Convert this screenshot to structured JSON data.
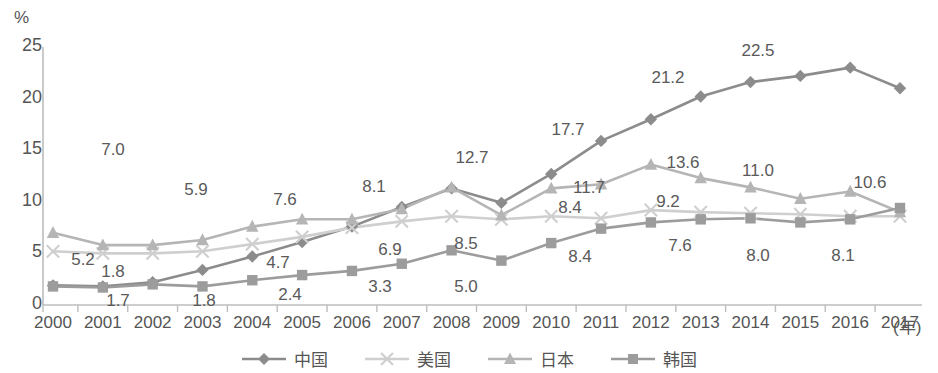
{
  "chart_data": {
    "type": "line",
    "title": "",
    "subtitle": "",
    "xlabel": "(年)",
    "ylabel": "%",
    "ylim": [
      0,
      25
    ],
    "yticks": [
      0,
      5,
      10,
      15,
      20,
      25
    ],
    "grid": false,
    "legend_position": "bottom",
    "categories": [
      "2000",
      "2001",
      "2002",
      "2003",
      "2004",
      "2005",
      "2006",
      "2007",
      "2008",
      "2009",
      "2010",
      "2011",
      "2012",
      "2013",
      "2014",
      "2015",
      "2016",
      "2017"
    ],
    "series": [
      {
        "name": "中国",
        "marker": "diamond",
        "color": "#8c8c8c",
        "values": [
          1.9,
          1.8,
          2.2,
          3.4,
          4.7,
          6.1,
          7.6,
          9.5,
          11.3,
          9.9,
          12.7,
          15.9,
          18.0,
          20.2,
          21.6,
          22.2,
          23.0,
          21.0
        ]
      },
      {
        "name": "美国",
        "marker": "cross",
        "color": "#cfcfcf",
        "values": [
          5.2,
          5.0,
          5.0,
          5.2,
          5.9,
          6.6,
          7.5,
          8.1,
          8.6,
          8.3,
          8.6,
          8.4,
          9.2,
          9.0,
          8.9,
          8.8,
          8.6,
          8.6
        ]
      },
      {
        "name": "日本",
        "marker": "triangle",
        "color": "#b5b5b5",
        "values": [
          7.0,
          5.8,
          5.8,
          6.3,
          7.6,
          8.3,
          8.3,
          9.3,
          11.4,
          8.7,
          11.3,
          11.7,
          13.6,
          12.3,
          11.4,
          10.3,
          11.0,
          9.0
        ]
      },
      {
        "name": "韩国",
        "marker": "square",
        "color": "#9c9c9c",
        "values": [
          1.8,
          1.7,
          2.0,
          1.8,
          2.4,
          2.9,
          3.3,
          4.0,
          5.3,
          4.3,
          6.0,
          7.4,
          8.0,
          8.3,
          8.4,
          8.0,
          8.3,
          9.4
        ]
      }
    ],
    "annotations": [
      {
        "text": "7.0",
        "series": "日本",
        "index": 1,
        "x": 113,
        "y": 140,
        "align": "above"
      },
      {
        "text": "5.2",
        "series": "美国",
        "index": 1,
        "x": 83,
        "y": 250,
        "align": "below"
      },
      {
        "text": "1.8",
        "series": "中国",
        "index": 1,
        "x": 113,
        "y": 262,
        "align": "above"
      },
      {
        "text": "1.7",
        "series": "韩国",
        "index": 1,
        "x": 118,
        "y": 291,
        "align": "below"
      },
      {
        "text": "5.9",
        "series": "日本",
        "index": 3,
        "x": 196,
        "y": 180,
        "align": "above"
      },
      {
        "text": "1.8",
        "series": "韩国",
        "index": 3,
        "x": 204,
        "y": 291,
        "align": "below"
      },
      {
        "text": "7.6",
        "series": "日本",
        "index": 5,
        "x": 285,
        "y": 190,
        "align": "above"
      },
      {
        "text": "4.7",
        "series": "中国",
        "index": 5,
        "x": 278,
        "y": 253,
        "align": "above"
      },
      {
        "text": "2.4",
        "series": "韩国",
        "index": 5,
        "x": 290,
        "y": 285,
        "align": "below"
      },
      {
        "text": "8.1",
        "series": "中国",
        "index": 7,
        "x": 374,
        "y": 177,
        "align": "above"
      },
      {
        "text": "6.9",
        "series": "韩国",
        "index": 7,
        "x": 390,
        "y": 240,
        "align": "above"
      },
      {
        "text": "3.3",
        "series": "韩国",
        "index": 7,
        "x": 380,
        "y": 277,
        "align": "below"
      },
      {
        "text": "12.7",
        "series": "中国",
        "index": 10,
        "x": 472,
        "y": 148,
        "align": "above"
      },
      {
        "text": "8.5",
        "series": "日本",
        "index": 9,
        "x": 466,
        "y": 234,
        "align": "below"
      },
      {
        "text": "5.0",
        "series": "韩国",
        "index": 9,
        "x": 466,
        "y": 277,
        "align": "below"
      },
      {
        "text": "17.7",
        "series": "中国",
        "index": 11,
        "x": 568,
        "y": 120,
        "align": "above"
      },
      {
        "text": "11.7",
        "series": "日本",
        "index": 11,
        "x": 589,
        "y": 178,
        "align": "below"
      },
      {
        "text": "8.4",
        "series": "美国",
        "index": 11,
        "x": 570,
        "y": 198,
        "align": "below"
      },
      {
        "text": "8.4",
        "series": "韩国",
        "index": 11,
        "x": 580,
        "y": 247,
        "align": "below"
      },
      {
        "text": "21.2",
        "series": "中国",
        "index": 13,
        "x": 668,
        "y": 68,
        "align": "above"
      },
      {
        "text": "13.6",
        "series": "日本",
        "index": 12,
        "x": 683,
        "y": 153,
        "align": "above"
      },
      {
        "text": "9.2",
        "series": "美国",
        "index": 12,
        "x": 668,
        "y": 192,
        "align": "below"
      },
      {
        "text": "7.6",
        "series": "韩国",
        "index": 13,
        "x": 680,
        "y": 236,
        "align": "below"
      },
      {
        "text": "22.5",
        "series": "中国",
        "index": 15,
        "x": 758,
        "y": 41,
        "align": "above"
      },
      {
        "text": "11.0",
        "series": "日本",
        "index": 15,
        "x": 758,
        "y": 161,
        "align": "above"
      },
      {
        "text": "8.0",
        "series": "韩国",
        "index": 15,
        "x": 758,
        "y": 246,
        "align": "below"
      },
      {
        "text": "10.6",
        "series": "韩国",
        "index": 17,
        "x": 870,
        "y": 173,
        "align": "above"
      },
      {
        "text": "8.1",
        "series": "韩国",
        "index": 16,
        "x": 843,
        "y": 246,
        "align": "below"
      }
    ]
  },
  "axis": {
    "unit": "%",
    "x_unit": "(年)",
    "ytick_labels": [
      "25",
      "20",
      "15",
      "10",
      "5",
      "0"
    ],
    "xtick_labels": [
      "2000",
      "2001",
      "2002",
      "2003",
      "2004",
      "2005",
      "2006",
      "2007",
      "2008",
      "2009",
      "2010",
      "2011",
      "2012",
      "2013",
      "2014",
      "2015",
      "2016",
      "2017"
    ]
  },
  "legend": {
    "items": [
      {
        "label": "中国",
        "marker": "diamond",
        "color": "#8c8c8c"
      },
      {
        "label": "美国",
        "marker": "cross",
        "color": "#cfcfcf"
      },
      {
        "label": "日本",
        "marker": "triangle",
        "color": "#b5b5b5"
      },
      {
        "label": "韩国",
        "marker": "square",
        "color": "#9c9c9c"
      }
    ]
  }
}
